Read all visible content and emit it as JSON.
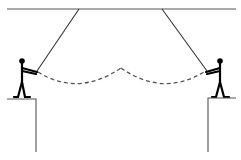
{
  "diagram": {
    "colors": {
      "line": "#555555",
      "figure": "#000000",
      "dash": "#555555",
      "background": "#ffffff"
    },
    "elements": [
      "ceiling",
      "left-rope",
      "right-rope",
      "left-person",
      "right-person",
      "left-ledge",
      "right-ledge",
      "left-swing-path",
      "right-swing-path"
    ]
  }
}
